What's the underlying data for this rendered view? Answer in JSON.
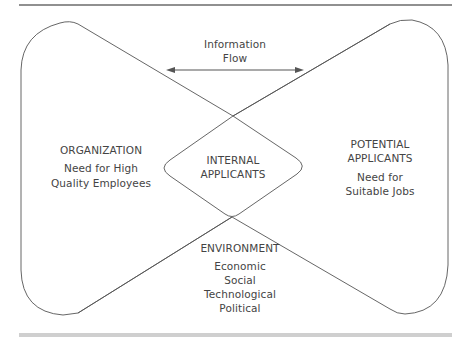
{
  "diagram": {
    "type": "hourglass-flow",
    "nodes": {
      "organization": {
        "title": "ORGANIZATION",
        "lines": [
          "Need for High",
          "Quality Employees"
        ]
      },
      "potential_applicants": {
        "title_lines": [
          "POTENTIAL",
          "APPLICANTS"
        ],
        "lines": [
          "Need for",
          "Suitable Jobs"
        ]
      },
      "internal_applicants": {
        "title_lines": [
          "INTERNAL",
          "APPLICANTS"
        ]
      },
      "environment": {
        "title": "ENVIRONMENT",
        "lines": [
          "Economic",
          "Social",
          "Technological",
          "Political"
        ]
      }
    },
    "edges": [
      {
        "id": "information-flow",
        "label_lines": [
          "Information",
          "Flow"
        ],
        "from": "organization",
        "to": "potential_applicants",
        "direction": "bidirectional"
      }
    ],
    "colors": {
      "stroke": "#555555",
      "top_rule": "#6b6b6b",
      "bottom_rule": "#c8c8c8",
      "text": "#444444"
    }
  }
}
